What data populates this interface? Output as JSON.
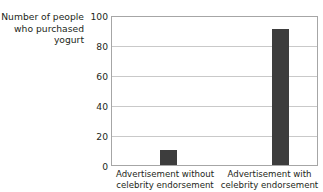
{
  "figure": {
    "top_cut_text": "",
    "background_color": "#ffffff"
  },
  "chart_data": {
    "type": "bar",
    "title": "",
    "xlabel": "",
    "ylabel": "Number of people who purchased yogurt",
    "ylabel_lines": [
      "Number of people",
      "who purchased",
      "yogurt"
    ],
    "categories": [
      "Advertisement without celebrity endorsement",
      "Advertisement with celebrity endorsement"
    ],
    "category_lines": [
      [
        "Advertisement without",
        "celebrity endorsement"
      ],
      [
        "Advertisement with",
        "celebrity endorsement"
      ]
    ],
    "values": [
      10,
      92
    ],
    "ylim": [
      0,
      100
    ],
    "yticks": [
      0,
      20,
      40,
      60,
      80,
      100
    ],
    "ytick_labels": [
      "0",
      "20",
      "40",
      "60",
      "80",
      "100"
    ],
    "grid": "horizontal",
    "legend": "none",
    "bar_color": "#3d3d3d",
    "grid_color": "#c9c9c9",
    "axis_color": "#a6a6a6"
  }
}
